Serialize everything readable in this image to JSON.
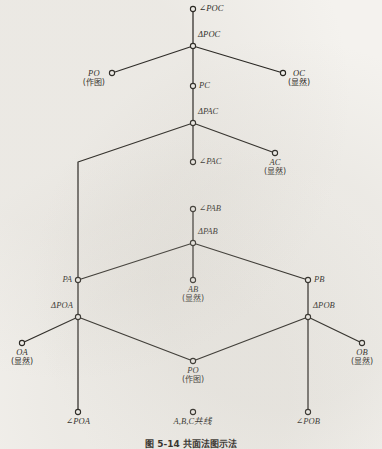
{
  "figure": {
    "caption": "图 5-14  共面法图示法",
    "note_colors": {
      "ink": "#15130f",
      "paper": "#f4f2ee"
    }
  },
  "nodes": [
    {
      "id": "angle-poc",
      "label": "∠POC",
      "sub": "",
      "x": 193,
      "y": 9,
      "label_pos": "right"
    },
    {
      "id": "tri-poc",
      "label": "ΔPOC",
      "sub": "",
      "x": 193,
      "y": 46,
      "label_pos": "right-above"
    },
    {
      "id": "po-top",
      "label": "PO",
      "sub": "(作图)",
      "x": 112,
      "y": 73,
      "label_pos": "left-stack"
    },
    {
      "id": "oc",
      "label": "OC",
      "sub": "(显然)",
      "x": 283,
      "y": 73,
      "label_pos": "right-stack"
    },
    {
      "id": "pc",
      "label": "PC",
      "sub": "",
      "x": 193,
      "y": 86,
      "label_pos": "right"
    },
    {
      "id": "tri-pac",
      "label": "ΔPAC",
      "sub": "",
      "x": 193,
      "y": 123,
      "label_pos": "right-above"
    },
    {
      "id": "angle-pac",
      "label": "∠PAC",
      "sub": "",
      "x": 193,
      "y": 162,
      "label_pos": "right"
    },
    {
      "id": "ac",
      "label": "AC",
      "sub": "(显然)",
      "x": 275,
      "y": 153,
      "label_pos": "below-center"
    },
    {
      "id": "angle-pab",
      "label": "∠PAB",
      "sub": "",
      "x": 193,
      "y": 209,
      "label_pos": "right"
    },
    {
      "id": "tri-pab",
      "label": "ΔPAB",
      "sub": "",
      "x": 193,
      "y": 243,
      "label_pos": "right-above"
    },
    {
      "id": "pa",
      "label": "PA",
      "sub": "",
      "x": 78,
      "y": 280,
      "label_pos": "left"
    },
    {
      "id": "ab",
      "label": "AB",
      "sub": "(显然)",
      "x": 193,
      "y": 280,
      "label_pos": "below-center"
    },
    {
      "id": "pb",
      "label": "PB",
      "sub": "",
      "x": 308,
      "y": 280,
      "label_pos": "right"
    },
    {
      "id": "tri-poa",
      "label": "ΔPOA",
      "sub": "",
      "x": 78,
      "y": 317,
      "label_pos": "left-above"
    },
    {
      "id": "tri-pob",
      "label": "ΔPOB",
      "sub": "",
      "x": 308,
      "y": 317,
      "label_pos": "right-above"
    },
    {
      "id": "oa",
      "label": "OA",
      "sub": "(显然)",
      "x": 22,
      "y": 343,
      "label_pos": "below-center"
    },
    {
      "id": "ob",
      "label": "OB",
      "sub": "(显然)",
      "x": 362,
      "y": 343,
      "label_pos": "below-center"
    },
    {
      "id": "po-bottom",
      "label": "PO",
      "sub": "(作图)",
      "x": 193,
      "y": 361,
      "label_pos": "below-center"
    },
    {
      "id": "angle-poa",
      "label": "∠POA",
      "sub": "",
      "x": 78,
      "y": 412,
      "label_pos": "below-center"
    },
    {
      "id": "collinear",
      "label": "A,B,C共线",
      "sub": "",
      "x": 193,
      "y": 412,
      "label_pos": "below-center-cjk"
    },
    {
      "id": "angle-pob",
      "label": "∠POB",
      "sub": "",
      "x": 308,
      "y": 412,
      "label_pos": "below-center"
    }
  ],
  "edges": [
    {
      "id": "e-angle-poc-tri-poc",
      "points": "193,9 193,46"
    },
    {
      "id": "e-tri-poc-po",
      "points": "193,46 112,73"
    },
    {
      "id": "e-tri-poc-oc",
      "points": "193,46 283,73"
    },
    {
      "id": "e-tri-poc-pc",
      "points": "193,46 193,86"
    },
    {
      "id": "e-pc-tri-pac",
      "points": "193,86 193,123"
    },
    {
      "id": "e-tri-pac-angle-pac",
      "points": "193,123 193,162"
    },
    {
      "id": "e-tri-pac-ac",
      "points": "193,123 275,153"
    },
    {
      "id": "e-tri-pac-pa",
      "points": "193,123 78,162 78,280"
    },
    {
      "id": "e-angle-pab-tri-pab",
      "points": "193,209 193,243"
    },
    {
      "id": "e-tri-pab-pa",
      "points": "193,243 78,280"
    },
    {
      "id": "e-tri-pab-ab",
      "points": "193,243 193,280"
    },
    {
      "id": "e-tri-pab-pb",
      "points": "193,243 308,280"
    },
    {
      "id": "e-pa-tri-poa",
      "points": "78,280 78,317"
    },
    {
      "id": "e-pb-tri-pob",
      "points": "308,280 308,317"
    },
    {
      "id": "e-tri-poa-oa",
      "points": "78,317 22,343"
    },
    {
      "id": "e-tri-pob-ob",
      "points": "308,317 362,343"
    },
    {
      "id": "e-tri-poa-po",
      "points": "78,317 193,361"
    },
    {
      "id": "e-tri-pob-po",
      "points": "308,317 193,361"
    },
    {
      "id": "e-tri-poa-angle-poa",
      "points": "78,317 78,412"
    },
    {
      "id": "e-tri-pob-angle-pob",
      "points": "308,317 308,412"
    }
  ]
}
